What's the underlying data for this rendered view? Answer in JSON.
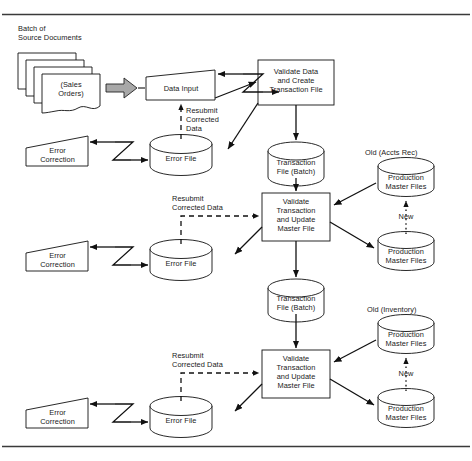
{
  "diagram": {
    "type": "flowchart",
    "frame": {
      "top_rule": true,
      "bottom_rule": true,
      "rule_color": "#3a3a3a"
    }
  },
  "source": {
    "caption_line1": "Batch of",
    "caption_line2": "Source Documents",
    "document_label_line1": "(Sales",
    "document_label_line2": "Orders)",
    "stack_count": 4,
    "block_arrow": "block-arrow-right",
    "block_arrow_fill": "#a8a8a8"
  },
  "stage1": {
    "data_input": "Data Input",
    "process": {
      "line1": "Validate Data",
      "line2": "and Create",
      "line3": "Transaction File"
    },
    "resubmit": {
      "line1": "Resubmit",
      "line2": "Corrected",
      "line3": "Data"
    },
    "error_file": "Error File",
    "error_correction": {
      "line1": "Error",
      "line2": "Correction"
    },
    "transaction_file": {
      "line1": "Transaction",
      "line2": "File (Batch)"
    }
  },
  "stage2": {
    "process": {
      "line1": "Validate",
      "line2": "Transaction",
      "line3": "and Update",
      "line4": "Master File"
    },
    "resubmit": {
      "line1": "Resubmit",
      "line2": "Corrected Data"
    },
    "error_file": "Error File",
    "error_correction": {
      "line1": "Error",
      "line2": "Correction"
    },
    "transaction_file": {
      "line1": "Transaction",
      "line2": "File (Batch)"
    },
    "old_label": "Old (Accts Rec)",
    "new_label": "New",
    "master_old": {
      "line1": "Production",
      "line2": "Master Files"
    },
    "master_new": {
      "line1": "Production",
      "line2": "Master Files"
    }
  },
  "stage3": {
    "process": {
      "line1": "Validate",
      "line2": "Transaction",
      "line3": "and Update",
      "line4": "Master File"
    },
    "resubmit": {
      "line1": "Resubmit",
      "line2": "Corrected Data"
    },
    "error_file": "Error File",
    "error_correction": {
      "line1": "Error",
      "line2": "Correction"
    },
    "old_label": "Old (Inventory)",
    "new_label": "New",
    "master_old": {
      "line1": "Production",
      "line2": "Master Files"
    },
    "master_new": {
      "line1": "Production",
      "line2": "Master Files"
    }
  },
  "colors": {
    "stroke": "#111111",
    "text": "#1a1a1a",
    "arrow_gray": "#a8a8a8",
    "background": "#ffffff"
  }
}
